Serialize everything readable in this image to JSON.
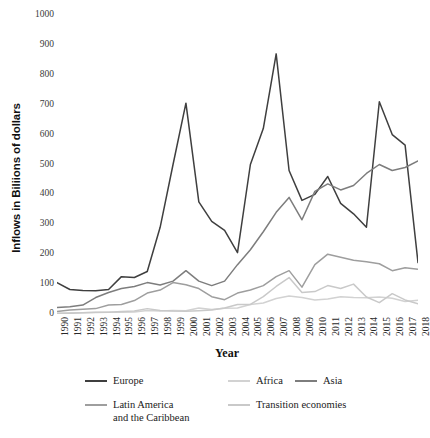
{
  "chart_data": {
    "type": "line",
    "title": "",
    "xlabel": "Year",
    "ylabel": "Inflows in Biliions of dollars",
    "grid": false,
    "legend_position": "bottom",
    "ylim": [
      0,
      1000
    ],
    "yticks": [
      0,
      100,
      200,
      300,
      400,
      500,
      600,
      700,
      800,
      900,
      1000
    ],
    "x": [
      1990,
      1991,
      1992,
      1993,
      1994,
      1995,
      1996,
      1997,
      1998,
      1999,
      2000,
      2001,
      2002,
      2003,
      2004,
      2005,
      2006,
      2007,
      2008,
      2009,
      2010,
      2011,
      2012,
      2013,
      2014,
      2015,
      2016,
      2017,
      2018
    ],
    "categories": [
      "1990",
      "1991",
      "1992",
      "1993",
      "1994",
      "1995",
      "1996",
      "1997",
      "1998",
      "1999",
      "2000",
      "2001",
      "2002",
      "2003",
      "2004",
      "2005",
      "2006",
      "2007",
      "2008",
      "2009",
      "2010",
      "2011",
      "2012",
      "2013",
      "2014",
      "2015",
      "2016",
      "2017",
      "2018"
    ],
    "series": [
      {
        "name": "Europe",
        "color": "#3f3f3f",
        "width": 1.5,
        "values": [
          105,
          82,
          79,
          78,
          82,
          125,
          122,
          142,
          290,
          500,
          705,
          375,
          310,
          280,
          205,
          500,
          620,
          870,
          480,
          380,
          400,
          460,
          370,
          335,
          290,
          710,
          600,
          565,
          172
        ]
      },
      {
        "name": "Asia",
        "color": "#7d7d7d",
        "width": 1.5,
        "values": [
          22,
          24,
          30,
          55,
          72,
          85,
          92,
          105,
          97,
          110,
          145,
          110,
          95,
          110,
          165,
          215,
          275,
          340,
          390,
          315,
          410,
          435,
          415,
          430,
          470,
          500,
          480,
          490,
          512
        ]
      },
      {
        "name": "Latin America\nand the Caribbean",
        "color": "#9e9e9e",
        "width": 1.5,
        "values": [
          8,
          13,
          16,
          18,
          30,
          32,
          45,
          70,
          80,
          105,
          98,
          85,
          58,
          48,
          70,
          80,
          95,
          125,
          145,
          90,
          165,
          200,
          190,
          180,
          175,
          168,
          145,
          155,
          150
        ]
      },
      {
        "name": "Africa",
        "color": "#d2d2d2",
        "width": 1.5,
        "values": [
          3,
          4,
          4,
          5,
          6,
          6,
          7,
          12,
          10,
          12,
          11,
          20,
          15,
          19,
          20,
          32,
          37,
          52,
          60,
          55,
          47,
          50,
          58,
          55,
          54,
          57,
          53,
          42,
          46
        ]
      },
      {
        "name": "Transition economies",
        "color": "#c9c9c9",
        "width": 1.5,
        "values": [
          1,
          2,
          4,
          6,
          6,
          8,
          10,
          18,
          12,
          10,
          9,
          11,
          13,
          20,
          32,
          32,
          58,
          92,
          122,
          72,
          75,
          95,
          85,
          100,
          57,
          38,
          68,
          47,
          34
        ]
      }
    ]
  },
  "legend": {
    "items": [
      {
        "label": "Europe",
        "color": "#3f3f3f"
      },
      {
        "label": "Africa",
        "color": "#d2d2d2"
      },
      {
        "label": "Asia",
        "color": "#7d7d7d"
      },
      {
        "label": "Latin America\nand the Caribbean",
        "color": "#9e9e9e"
      },
      {
        "label": "Transition economies",
        "color": "#c9c9c9"
      }
    ]
  }
}
